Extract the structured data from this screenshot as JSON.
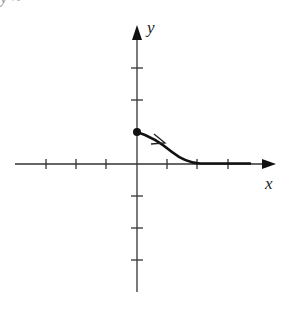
{
  "figure": {
    "type": "phase-line-trajectory",
    "x_axis_label": "x",
    "y_axis_label": "y",
    "top_fragment_text": "y ≈",
    "origin_px": [
      137,
      164
    ],
    "x_tick_spacing_px": 30.5,
    "y_tick_spacing_px": 32,
    "x_ticks": [
      -4,
      -3,
      -2,
      -1,
      1,
      2,
      3
    ],
    "y_ticks": [
      -4,
      -3,
      -2,
      -1,
      1,
      2,
      3
    ],
    "trajectory": {
      "start_point": [
        0,
        1
      ],
      "end_behavior": "approaches x-axis as x increases",
      "direction": "rightward / decreasing",
      "start_marker": "filled-dot",
      "color": "#111111"
    },
    "axis_color": "#333333"
  }
}
